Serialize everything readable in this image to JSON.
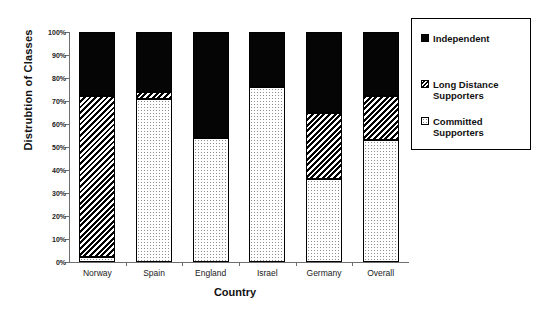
{
  "chart_data": {
    "type": "bar",
    "subtype": "stacked-percentage-column",
    "title": "",
    "xlabel": "Country",
    "ylabel": "Distrubtion of Classes",
    "categories": [
      "Norway",
      "Spain",
      "England",
      "Israel",
      "Germany",
      "Overall"
    ],
    "ylim": [
      0,
      100
    ],
    "yticks": [
      "0%",
      "10%",
      "20%",
      "30%",
      "40%",
      "50%",
      "60%",
      "70%",
      "80%",
      "90%",
      "100%"
    ],
    "ytick_values": [
      0,
      10,
      20,
      30,
      40,
      50,
      60,
      70,
      80,
      90,
      100
    ],
    "grid": false,
    "legend_position": "right",
    "stack_order_bottom_to_top": [
      "Committed Supporters",
      "Long Distance Supporters",
      "Independent"
    ],
    "series": [
      {
        "name": "Committed Supporters",
        "pattern": "dotted",
        "color": "#ffffff",
        "values": [
          2,
          71,
          54,
          76,
          36,
          53
        ]
      },
      {
        "name": "Long Distance Supporters",
        "pattern": "diagonal-hatch",
        "color": "#000000",
        "values": [
          70,
          3,
          0,
          0,
          29,
          19
        ]
      },
      {
        "name": "Independent",
        "pattern": "solid",
        "color": "#050505",
        "values": [
          28,
          26,
          46,
          24,
          35,
          28
        ]
      }
    ]
  },
  "legend": {
    "items": [
      {
        "label": "Independent",
        "swatch": "independent"
      },
      {
        "label": "Long Distance\nSupporters",
        "swatch": "longdistance"
      },
      {
        "label": "Committed\nSupporters",
        "swatch": "committed"
      }
    ]
  }
}
